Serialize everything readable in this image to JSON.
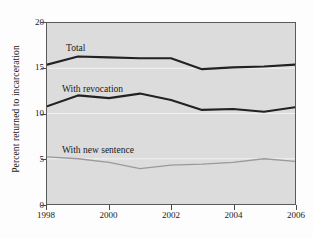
{
  "chart_data": {
    "type": "line",
    "title": "",
    "xlabel": "",
    "ylabel": "Percent returned to incarceration",
    "x": [
      1998,
      1999,
      2000,
      2001,
      2002,
      2003,
      2004,
      2005,
      2006
    ],
    "xlim": [
      1998,
      2006
    ],
    "ylim": [
      0,
      20
    ],
    "y_ticks": [
      0,
      5,
      10,
      15,
      20
    ],
    "x_ticks": [
      1998,
      2000,
      2002,
      2004,
      2006
    ],
    "x_tick_labels": [
      "1998",
      "2000",
      "2002",
      "2004",
      "2006"
    ],
    "y_tick_labels": [
      "0",
      "5",
      "10",
      "15",
      "20"
    ],
    "gridlines": [
      5,
      10,
      15
    ],
    "grid": true,
    "legend_position": "inline-labels",
    "plot_background": "#dcdcdc",
    "series": [
      {
        "name": "Total",
        "color": "#222222",
        "width": 2.1,
        "values": [
          15.4,
          16.3,
          16.2,
          16.1,
          16.1,
          14.9,
          15.1,
          15.2,
          15.4
        ]
      },
      {
        "name": "With revocation",
        "color": "#222222",
        "width": 2.1,
        "values": [
          10.8,
          12.0,
          11.7,
          12.2,
          11.5,
          10.4,
          10.5,
          10.2,
          10.7
        ]
      },
      {
        "name": "With new sentence",
        "color": "#9a9a9a",
        "width": 1.3,
        "values": [
          5.2,
          5.0,
          4.6,
          3.9,
          4.3,
          4.4,
          4.6,
          5.0,
          4.7
        ]
      }
    ]
  }
}
